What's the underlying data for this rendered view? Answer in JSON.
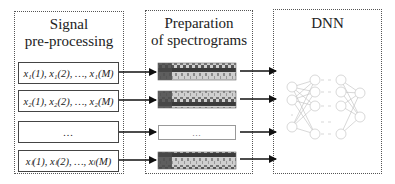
{
  "panels": [
    {
      "id": "signal",
      "title_lines": [
        "Signal",
        "pre-processing"
      ]
    },
    {
      "id": "spectrograms",
      "title_lines": [
        "Preparation",
        "of spectrograms"
      ]
    },
    {
      "id": "dnn",
      "title_lines": [
        "DNN"
      ]
    }
  ],
  "signals": [
    {
      "label": "x₁(1), x₁(2), …, x₁(M)"
    },
    {
      "label": "x₂(1), x₂(2), …, x₂(M)"
    },
    {
      "label": "…"
    },
    {
      "label": "xₗ(1), xₗ(2), …, xₗ(M)"
    }
  ],
  "spectrograms": [
    {
      "type": "image"
    },
    {
      "type": "image"
    },
    {
      "type": "ellipsis",
      "label": "…"
    },
    {
      "type": "image"
    }
  ],
  "dnn": {
    "layers": [
      3,
      4,
      4,
      2
    ],
    "ellipsis": "…"
  },
  "colors": {
    "border": "#555555",
    "arrow": "#111111",
    "network": "#b8b8b8",
    "spectrogram_dark": "#3a3a3a",
    "spectrogram_light": "#d0d0d0"
  }
}
